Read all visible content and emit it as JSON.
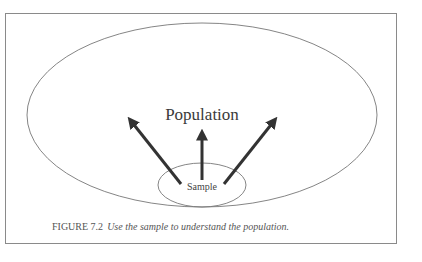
{
  "diagram": {
    "population_label": "Population",
    "sample_label": "Sample",
    "arrows": [
      {
        "direction": "upper-left"
      },
      {
        "direction": "up"
      },
      {
        "direction": "upper-right"
      }
    ],
    "colors": {
      "frame": "#8a8a8a",
      "ellipse_stroke": "#777777",
      "arrow": "#333333",
      "text": "#3a3a3a"
    }
  },
  "caption": {
    "label": "FIGURE 7.2",
    "text": "Use the sample to understand the population."
  }
}
